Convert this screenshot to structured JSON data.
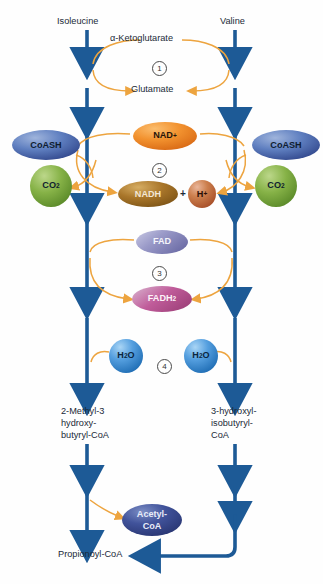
{
  "diagram": {
    "colors": {
      "arrow_blue": "#1d5a96",
      "arrow_blue_dark": "#18456f",
      "curve_orange": "#e6a33c",
      "text": "#1b2a38",
      "coash_blue": "#4a6fb0",
      "co2_green": "#7dab3e",
      "nad_orange": "#ef8b2c",
      "nadh_brown": "#a9762a",
      "h_copper": "#c4703f",
      "fad_purple": "#8e8fc0",
      "fadh2_magenta": "#b8538f",
      "h2o_blue": "#4e9fe0",
      "acetyl_navy": "#3a4f96"
    }
  },
  "inputs": {
    "left": "Isoleucine",
    "right": "Valine"
  },
  "steps": [
    {
      "number": "1",
      "label": "transamination"
    },
    {
      "number": "2",
      "label": "oxidative-decarboxylation"
    },
    {
      "number": "3",
      "label": "dehydrogenation"
    },
    {
      "number": "4",
      "label": "hydration"
    }
  ],
  "step_numbers": {
    "one": "1",
    "two": "2",
    "three": "3",
    "four": "4"
  },
  "cofactors": {
    "alpha_ketoglutarate": "α-Ketoglutarate",
    "glutamate": "Glutamate",
    "coash_left": "CoASH",
    "coash_right": "CoASH",
    "co2_left_main": "CO",
    "co2_left_sub": "2",
    "co2_right_main": "CO",
    "co2_right_sub": "2",
    "nad_main": "NAD",
    "nad_sup": "+",
    "nadh": "NADH",
    "plus_sign": "+",
    "proton_main": "H",
    "proton_sup": "+",
    "fad": "FAD",
    "fadh2_main": "FADH",
    "fadh2_sub": "2",
    "h2o_left_a": "H",
    "h2o_left_sub": "2",
    "h2o_left_b": "O",
    "h2o_right_a": "H",
    "h2o_right_sub": "2",
    "h2o_right_b": "O"
  },
  "intermediates": {
    "left_line1": "2-Methyl-3",
    "left_line2": "hydroxy-",
    "left_line3": "butyryl-CoA",
    "right_line1": "3-hydroxyl-",
    "right_line2": "isobutyryl-",
    "right_line3": "CoA"
  },
  "products": {
    "acetyl_line1": "Acetyl-",
    "acetyl_line2": "CoA",
    "propionoyl": "Propionoyl-CoA"
  }
}
